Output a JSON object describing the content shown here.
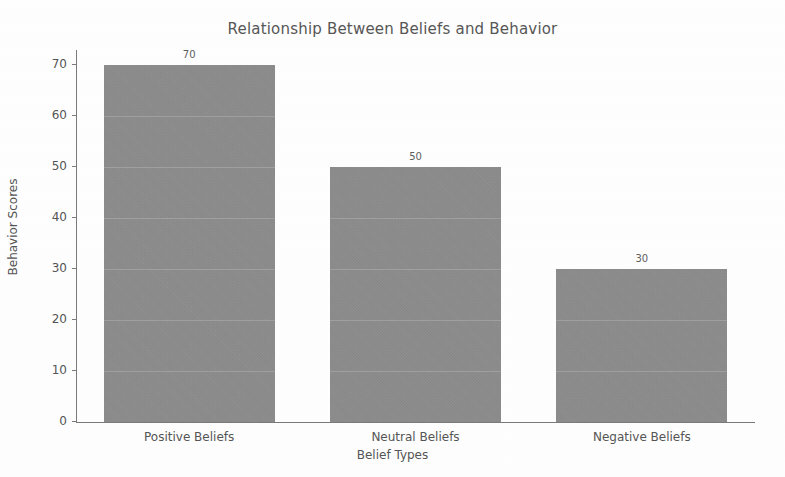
{
  "chart_data": {
    "type": "bar",
    "title": "Relationship Between Beliefs and Behavior",
    "xlabel": "Belief Types",
    "ylabel": "Behavior Scores",
    "categories": [
      "Positive Beliefs",
      "Neutral Beliefs",
      "Negative Beliefs"
    ],
    "values": [
      70,
      50,
      30
    ],
    "value_labels": [
      "70",
      "50",
      "30"
    ],
    "ylim": [
      0,
      73
    ],
    "yticks": [
      0,
      10,
      20,
      30,
      40,
      50,
      60,
      70
    ],
    "ytick_labels": [
      "0",
      "10",
      "20",
      "30",
      "40",
      "50",
      "60",
      "70"
    ],
    "grid": false,
    "legend": false,
    "bar_color": "#8e8e8e",
    "text_color": "#555555",
    "axis_color": "#7b7b7b",
    "background": "#ffffff"
  }
}
